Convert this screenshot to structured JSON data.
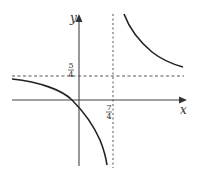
{
  "diagram": {
    "type": "rational-function-graph",
    "axes": {
      "x_label": "x",
      "y_label": "y"
    },
    "asymptotes": {
      "horizontal": {
        "numerator": "5",
        "denominator": "4",
        "value": 1.25
      },
      "vertical": {
        "numerator": "7",
        "denominator": "4",
        "value": 1.75
      }
    },
    "colors": {
      "curve": "#222222",
      "axis": "#444444",
      "asymptote": "#555555"
    }
  }
}
